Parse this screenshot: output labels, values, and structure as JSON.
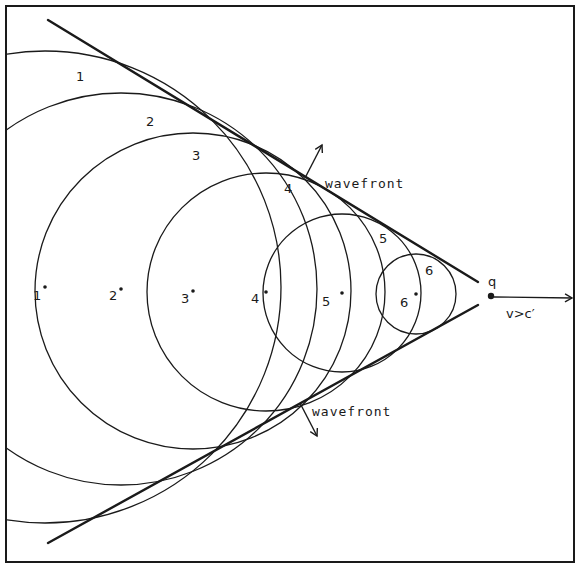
{
  "figure": {
    "frame": {
      "x": 6,
      "y": 6,
      "width": 568,
      "height": 556
    },
    "stroke_color": "#1a1a1a",
    "background": "#ffffff"
  },
  "particle": {
    "label": "q",
    "position": {
      "x": 491,
      "y": 296
    },
    "velocity_label": "v>c′",
    "arrow_end_x": 572
  },
  "wavefronts": {
    "label": "wavefront",
    "upper": {
      "from": {
        "x": 48,
        "y": 20
      },
      "to": {
        "x": 478,
        "y": 282
      },
      "label_pos": {
        "x": 325,
        "y": 188
      },
      "arrow_from": {
        "x": 305,
        "y": 178
      },
      "arrow_to": {
        "x": 322,
        "y": 145
      }
    },
    "lower": {
      "from": {
        "x": 48,
        "y": 543
      },
      "to": {
        "x": 478,
        "y": 305
      },
      "label_pos": {
        "x": 312,
        "y": 416
      },
      "arrow_from": {
        "x": 300,
        "y": 403
      },
      "arrow_to": {
        "x": 317,
        "y": 436
      }
    }
  },
  "emission_points": [
    {
      "id": "1",
      "cx": 45,
      "cy": 287,
      "r": 236,
      "center_label": {
        "x": 33,
        "y": 300
      },
      "arc_label": {
        "x": 76,
        "y": 81
      }
    },
    {
      "id": "2",
      "cx": 121,
      "cy": 289,
      "r": 196,
      "center_label": {
        "x": 109,
        "y": 300
      },
      "arc_label": {
        "x": 146,
        "y": 126
      }
    },
    {
      "id": "3",
      "cx": 193,
      "cy": 291,
      "r": 158,
      "center_label": {
        "x": 181,
        "y": 303
      },
      "arc_label": {
        "x": 192,
        "y": 160
      }
    },
    {
      "id": "4",
      "cx": 266,
      "cy": 292,
      "r": 119,
      "center_label": {
        "x": 251,
        "y": 303
      },
      "arc_label": {
        "x": 284,
        "y": 193
      }
    },
    {
      "id": "5",
      "cx": 342,
      "cy": 293,
      "r": 79,
      "center_label": {
        "x": 322,
        "y": 306
      },
      "arc_label": {
        "x": 379,
        "y": 243
      }
    },
    {
      "id": "6",
      "cx": 416,
      "cy": 294,
      "r": 40,
      "center_label": {
        "x": 400,
        "y": 307
      },
      "arc_label": {
        "x": 425,
        "y": 275
      }
    }
  ]
}
